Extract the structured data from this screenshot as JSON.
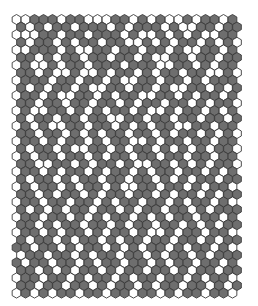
{
  "board": {
    "type": "hex-grid",
    "orientation": "pointy-top",
    "origin_x": 16.5,
    "origin_y": 19.5,
    "cell_width": 9.0,
    "row_pitch": 7.6,
    "hex_radius": 5.0,
    "colors": {
      "W": "#ffffff",
      "G": "#6e6e6e",
      "stroke": "#3a3a3a",
      "background": "#ffffff"
    },
    "rows": [
      "WWGGGWGGWWWGGWGWGWWGWGGWG",
      "GWGWGGWGGGWGWGGGWGWWGGWGG",
      "WWWGGWGGWGGGWGWWGWGWGWWGG",
      "GWGGWGWGGWGGWWGWGWGGWGWGW",
      "WWGGGWGWWGGWGGWGGWGWWGGWG",
      "GGWGWGGWGGWGGWGWWGGWGGWGG",
      "WGWWGWGGWGGGWGGGWWGGWGWGG",
      "GGWGWWGWWGWGGWGWGGWGGWWGW",
      "WGGGWGGWGGWGWWGGWGGWGWGGG",
      "GWGWGGWGWWGGWGGWGWWGGWGWG",
      "WGGWGWWGGWGWGGWWGGWGWGGWG",
      "GGWGGWGGWGGWGWGGWGGWGWGGW",
      "WGWWGGWGWGWGGWGWWGWGGWGWG",
      "GWGGWGGWGGWWGGWGGWGGWGGWG",
      "WGWGWWGGWGGWGWGWGGWWGGWGG",
      "GGWGGWGWGWGGWGGWGWGGWGWGW",
      "WGGWGWGGWGWGGWWGWGGWGGWGG",
      "GWGGWGWWGGWGWGGWGWGWGWGGW",
      "WGWGGWGGWGWGGWGGWGGWGGWGG",
      "GGWWGGWGWGGWGWWGGWGWGWGGW",
      "WGGWGWGGWGWGGWGWGGWGGWGWG",
      "GWGGWGWGGWGGWGGWGWGWGGWGG",
      "WGWGGWGWGGWGWWGGWGGWGWGGW",
      "GGWGWGGWGWGGWGGWGWGGWGWGG",
      "WGGWGGWGGWGWGGWGGWGWGGWGW",
      "GWGWGWGGWGGWGWGGWGGWGWGGG",
      "WGGWGGWGWGWGGWGWGWGGWGGWG",
      "GGWGWGGWGGWGWGGWGGWGWGWGG",
      "WGGWGWGGWGWGGWGWWGWGGWGGW",
      "GWGGWGWGGWGWGGWGGWGGWGWGG",
      "GGWGGWGWGGWGWGWGGWGWGGWGW",
      "WGGWGGWGWGGWGGWGWGGWGWGGG",
      "GWGGWGGWGWGGWGGWGWGGWGGWG",
      "GGWGWGWGGWGWGGWGGWGWGGWGG",
      "WGGWGGWGWGGWGWGGWGGWGWGGW",
      "GGWGGWGGWGWGGWGWGGWGGWGWG",
      "WGWGWGGWGGWGGWGGWGWGGWGGW"
    ]
  }
}
